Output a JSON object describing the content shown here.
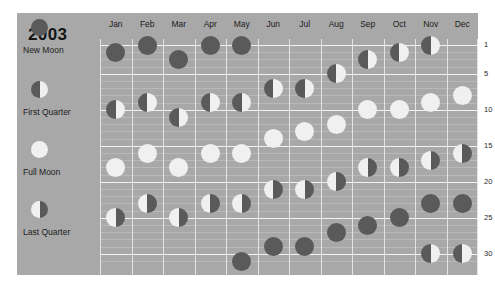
{
  "title": "2003",
  "legend": {
    "items": [
      {
        "label": "New Moon",
        "phase": "new"
      },
      {
        "label": "First Quarter",
        "phase": "first"
      },
      {
        "label": "Full Moon",
        "phase": "full"
      },
      {
        "label": "Last Quarter",
        "phase": "last"
      }
    ]
  },
  "colors": {
    "panel_background": "#a8a8a8",
    "dark_disc": "#5a5a5a",
    "light_disc": "#f0f0f0",
    "gridline": "#e4e4e4",
    "major_gridline": "#f2f2f2",
    "text": "#1c1c1c",
    "page_background": "#ffffff"
  },
  "axis": {
    "day_ticks": [
      1,
      5,
      10,
      15,
      20,
      25,
      30
    ],
    "day_min": 1,
    "day_max": 31,
    "minor_step": 1
  },
  "chart_data": {
    "type": "scatter",
    "title": "2003",
    "xlabel": "",
    "ylabel": "",
    "categories": [
      "Jan",
      "Feb",
      "Mar",
      "Apr",
      "May",
      "Jun",
      "Jul",
      "Aug",
      "Sep",
      "Oct",
      "Nov",
      "Dec"
    ],
    "ylim": [
      1,
      31
    ],
    "ytick_labels": [
      "1",
      "5",
      "10",
      "15",
      "20",
      "25",
      "30"
    ],
    "grid": true,
    "legend_position": "left",
    "phase_legend": [
      "New Moon",
      "First Quarter",
      "Full Moon",
      "Last Quarter"
    ],
    "series": [
      {
        "name": "New Moon",
        "phase": "new",
        "points": [
          {
            "month": "Jan",
            "day": 2
          },
          {
            "month": "Feb",
            "day": 1
          },
          {
            "month": "Mar",
            "day": 3
          },
          {
            "month": "Apr",
            "day": 1
          },
          {
            "month": "May",
            "day": 1
          },
          {
            "month": "May",
            "day": 31
          },
          {
            "month": "Jun",
            "day": 29
          },
          {
            "month": "Jul",
            "day": 29
          },
          {
            "month": "Aug",
            "day": 27
          },
          {
            "month": "Sep",
            "day": 26
          },
          {
            "month": "Oct",
            "day": 25
          },
          {
            "month": "Nov",
            "day": 23
          },
          {
            "month": "Dec",
            "day": 23
          }
        ]
      },
      {
        "name": "First Quarter",
        "phase": "first",
        "points": [
          {
            "month": "Jan",
            "day": 10
          },
          {
            "month": "Feb",
            "day": 9
          },
          {
            "month": "Mar",
            "day": 11
          },
          {
            "month": "Apr",
            "day": 9
          },
          {
            "month": "May",
            "day": 9
          },
          {
            "month": "Jun",
            "day": 7
          },
          {
            "month": "Jul",
            "day": 7
          },
          {
            "month": "Aug",
            "day": 5
          },
          {
            "month": "Sep",
            "day": 3
          },
          {
            "month": "Oct",
            "day": 2
          },
          {
            "month": "Nov",
            "day": 1
          },
          {
            "month": "Nov",
            "day": 30
          },
          {
            "month": "Dec",
            "day": 30
          }
        ]
      },
      {
        "name": "Full Moon",
        "phase": "full",
        "points": [
          {
            "month": "Jan",
            "day": 18
          },
          {
            "month": "Feb",
            "day": 16
          },
          {
            "month": "Mar",
            "day": 18
          },
          {
            "month": "Apr",
            "day": 16
          },
          {
            "month": "May",
            "day": 16
          },
          {
            "month": "Jun",
            "day": 14
          },
          {
            "month": "Jul",
            "day": 13
          },
          {
            "month": "Aug",
            "day": 12
          },
          {
            "month": "Sep",
            "day": 10
          },
          {
            "month": "Oct",
            "day": 10
          },
          {
            "month": "Nov",
            "day": 9
          },
          {
            "month": "Dec",
            "day": 8
          }
        ]
      },
      {
        "name": "Last Quarter",
        "phase": "last",
        "points": [
          {
            "month": "Jan",
            "day": 25
          },
          {
            "month": "Feb",
            "day": 23
          },
          {
            "month": "Mar",
            "day": 25
          },
          {
            "month": "Apr",
            "day": 23
          },
          {
            "month": "May",
            "day": 23
          },
          {
            "month": "Jun",
            "day": 21
          },
          {
            "month": "Jul",
            "day": 21
          },
          {
            "month": "Aug",
            "day": 20
          },
          {
            "month": "Sep",
            "day": 18
          },
          {
            "month": "Oct",
            "day": 18
          },
          {
            "month": "Nov",
            "day": 17
          },
          {
            "month": "Dec",
            "day": 16
          }
        ]
      }
    ]
  }
}
